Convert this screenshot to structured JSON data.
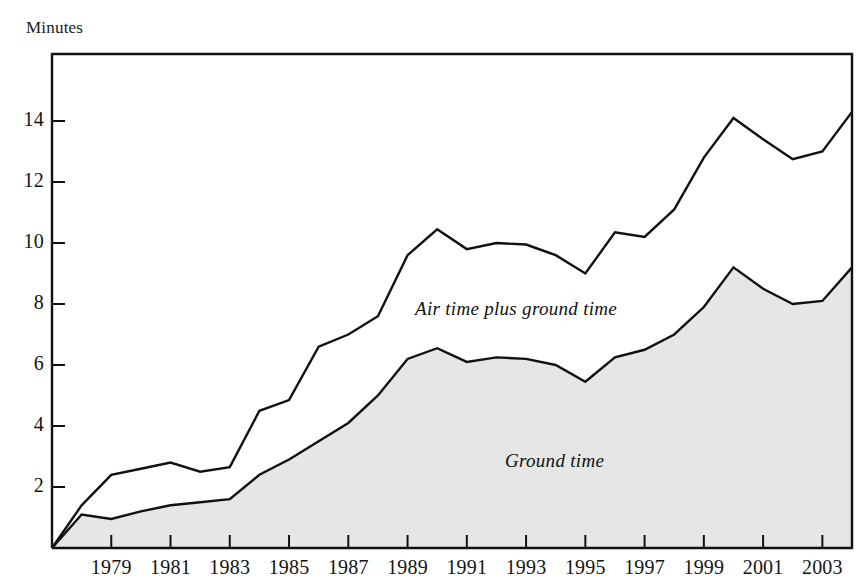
{
  "figure": {
    "cropped_title_fragment": "",
    "y_axis_title": "Minutes"
  },
  "labels": {
    "upper_series": "Air time plus ground time",
    "lower_series": "Ground time"
  },
  "colors": {
    "line": "#111111",
    "fill": "#e6e6e6",
    "axis": "#111111",
    "text": "#141414"
  },
  "chart_data": {
    "type": "area",
    "title": "Minutes",
    "xlabel": "",
    "ylabel": "Minutes",
    "xlim": [
      1977,
      2004
    ],
    "ylim": [
      0,
      15.2
    ],
    "yticks": [
      2,
      4,
      6,
      8,
      10,
      12,
      14
    ],
    "xticks": [
      1979,
      1981,
      1983,
      1985,
      1987,
      1989,
      1991,
      1993,
      1995,
      1997,
      1999,
      2001,
      2003
    ],
    "xtick_labels": [
      "1979",
      "1981",
      "1983",
      "1985",
      "1987",
      "1989",
      "1991",
      "1993",
      "1995",
      "1997",
      "1999",
      "2001",
      "2003"
    ],
    "ytick_labels": [
      "2",
      "4",
      "6",
      "8",
      "10",
      "12",
      "14"
    ],
    "grid": false,
    "legend": "inline-annotations",
    "x": [
      1977,
      1978,
      1979,
      1980,
      1981,
      1982,
      1983,
      1984,
      1985,
      1986,
      1987,
      1988,
      1989,
      1990,
      1991,
      1992,
      1993,
      1994,
      1995,
      1996,
      1997,
      1998,
      1999,
      2000,
      2001,
      2002,
      2003,
      2004
    ],
    "series": [
      {
        "name": "Air time plus ground time",
        "annotation": "Air time plus ground time",
        "values": [
          0.0,
          1.4,
          2.4,
          2.6,
          2.8,
          2.5,
          2.65,
          4.5,
          4.85,
          6.6,
          7.0,
          7.6,
          9.6,
          10.45,
          9.8,
          10.0,
          9.95,
          9.6,
          9.0,
          10.35,
          10.2,
          11.1,
          12.8,
          14.1,
          13.4,
          12.75,
          13.0,
          14.3
        ]
      },
      {
        "name": "Ground time",
        "annotation": "Ground time",
        "values": [
          0.0,
          1.1,
          0.95,
          1.2,
          1.4,
          1.5,
          1.6,
          2.4,
          2.9,
          3.5,
          4.1,
          5.0,
          6.2,
          6.55,
          6.1,
          6.25,
          6.2,
          6.0,
          5.45,
          6.25,
          6.5,
          7.0,
          7.9,
          9.2,
          8.5,
          8.0,
          8.1,
          9.2
        ]
      }
    ]
  },
  "geometry": {
    "plot_left": 52,
    "plot_right": 852,
    "plot_top": 54,
    "plot_bottom": 548,
    "y_value_at_top": 16.2,
    "px_per_unit_y": 30.5
  }
}
